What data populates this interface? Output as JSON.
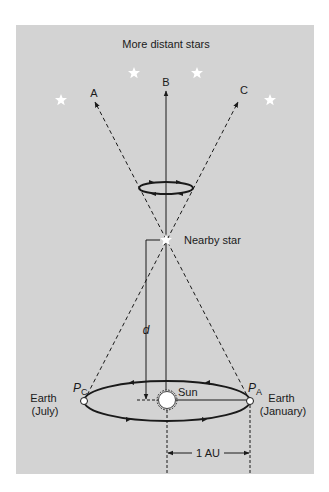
{
  "figure": {
    "title": "More distant stars",
    "direction_labels": [
      "A",
      "B",
      "C"
    ],
    "nearby_star_label": "Nearby star",
    "distance_label": "d",
    "sun_label": "Sun",
    "earth_left": {
      "line1": "Earth",
      "line2": "(July)",
      "point": "P",
      "point_sub": "C"
    },
    "earth_right": {
      "line1": "Earth",
      "line2": "(January)",
      "point": "P",
      "point_sub": "A"
    },
    "baseline_label": "1 AU",
    "colors": {
      "panel": "#d3d3d3",
      "line": "#1a1a1a",
      "star": "#ffffff"
    }
  }
}
